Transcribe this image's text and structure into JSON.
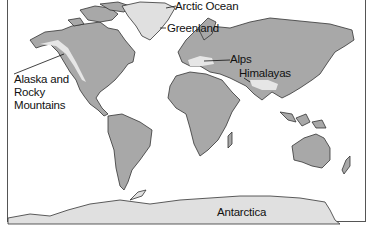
{
  "map": {
    "title": "World map of mountain ranges and polar regions",
    "colors": {
      "land": "#a8a8a8",
      "ice": "#e0e0e0",
      "mountain_highlight": "#e6e6e6",
      "outline": "#333333",
      "ocean": "#ffffff"
    },
    "labels": {
      "arctic_ocean": "Arctic Ocean",
      "greenland": "Greenland",
      "alaska_rocky": "Alaska and Rocky Mountains",
      "alps": "Alps",
      "himalayas": "Himalayas",
      "antarctica": "Antarctica"
    }
  }
}
